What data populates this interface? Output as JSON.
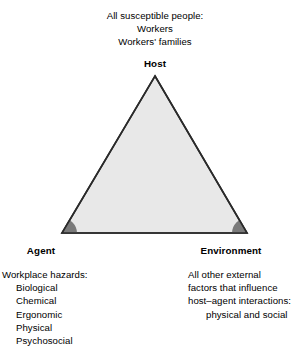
{
  "diagram": {
    "colors": {
      "triangle_fill": "#e8e8e8",
      "triangle_stroke": "#2a2a2a",
      "vertex_arc": "#7a7a7a",
      "text": "#000000",
      "background": "#ffffff"
    },
    "host": {
      "label": "Host",
      "description_lines": [
        "All susceptible people:",
        "Workers",
        "Workers' families"
      ]
    },
    "agent": {
      "label": "Agent",
      "description_heading": "Workplace hazards:",
      "description_items": [
        "Biological",
        "Chemical",
        "Ergonomic",
        "Physical",
        "Psychosocial"
      ]
    },
    "environment": {
      "label": "Environment",
      "description_lines": [
        "All other external",
        "factors that influence",
        "host–agent interactions:"
      ],
      "description_indented_line": "physical and social"
    }
  }
}
